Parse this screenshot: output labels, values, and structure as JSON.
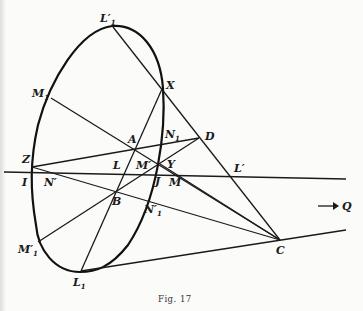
{
  "figure": {
    "caption": "Fig. 17",
    "arrow_label": "→ Q",
    "points": {
      "L1p": {
        "label": "L′",
        "sub": "1"
      },
      "X": {
        "label": "X"
      },
      "M1": {
        "label": "M",
        "sub": "1"
      },
      "A": {
        "label": "A"
      },
      "N1": {
        "label": "N",
        "sub": "1"
      },
      "D": {
        "label": "D"
      },
      "Z": {
        "label": "Z"
      },
      "L": {
        "label": "L"
      },
      "Mp": {
        "label": "M′"
      },
      "Y": {
        "label": "Y"
      },
      "Lp": {
        "label": "L′"
      },
      "I": {
        "label": "I"
      },
      "Np": {
        "label": "N′"
      },
      "J": {
        "label": "J"
      },
      "M": {
        "label": "M"
      },
      "B": {
        "label": "B"
      },
      "N1p": {
        "label": "N′",
        "sub": "1"
      },
      "M1p": {
        "label": "M′",
        "sub": "1"
      },
      "C": {
        "label": "C"
      },
      "L1": {
        "label": "L",
        "sub": "1"
      },
      "Q": {
        "label": "Q"
      }
    }
  }
}
